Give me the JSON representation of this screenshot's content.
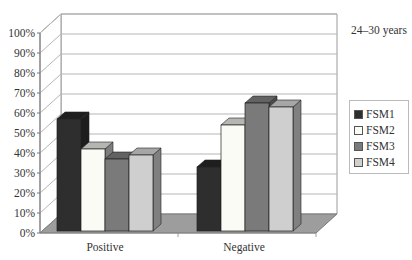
{
  "chart_data": {
    "type": "bar",
    "style": "3d-clustered-column",
    "title": "",
    "subtitle": "24–30 years",
    "categories": [
      "Positive",
      "Negative"
    ],
    "series": [
      {
        "name": "FSM1",
        "color": "#2e2e2e",
        "values": [
          56,
          32
        ]
      },
      {
        "name": "FSM2",
        "color": "#fbfbf6",
        "values": [
          41,
          53
        ]
      },
      {
        "name": "FSM3",
        "color": "#7a7a7a",
        "values": [
          36,
          64
        ]
      },
      {
        "name": "FSM4",
        "color": "#cfcfcf",
        "values": [
          38,
          62
        ]
      }
    ],
    "xlabel": "",
    "ylabel": "",
    "ylim": [
      0,
      100
    ],
    "yticks": [
      "0%",
      "10%",
      "20%",
      "30%",
      "40%",
      "50%",
      "60%",
      "70%",
      "80%",
      "90%",
      "100%"
    ],
    "grid": true,
    "legend_position": "right"
  },
  "legend": {
    "items": [
      "FSM1",
      "FSM2",
      "FSM3",
      "FSM4"
    ]
  }
}
